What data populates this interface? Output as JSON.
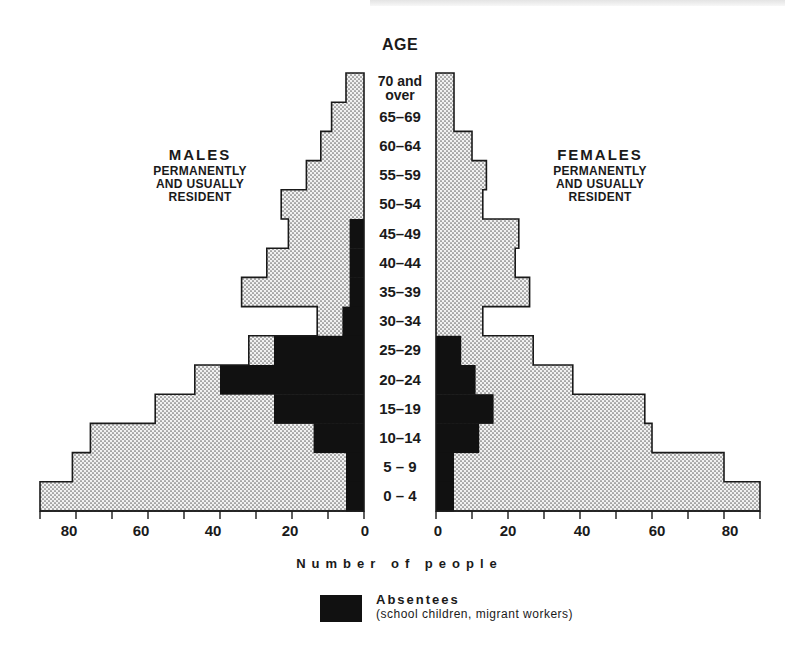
{
  "chart_data": {
    "type": "bar",
    "subtype": "population-pyramid",
    "title": "",
    "center_label": "AGE",
    "xlabel": "Number of people",
    "ylabel": "AGE",
    "xlim": [
      0,
      90
    ],
    "x_ticks": [
      0,
      20,
      40,
      60,
      80
    ],
    "x_minor_ticks_every": 10,
    "grid": false,
    "categories": [
      "70 and over",
      "65-69",
      "60-64",
      "55-59",
      "50-54",
      "45-49",
      "40-44",
      "35-39",
      "30-34",
      "25-29",
      "20-24",
      "15-19",
      "10-14",
      "5-9",
      "0-4"
    ],
    "series": [
      {
        "name": "Males permanently and usually resident (total)",
        "side": "left",
        "fill": "dotted",
        "values": [
          5,
          9,
          12,
          16,
          23,
          21,
          27,
          34,
          13,
          32,
          47,
          58,
          76,
          81,
          90
        ]
      },
      {
        "name": "Males absentees",
        "side": "left",
        "fill": "solid",
        "values": [
          0,
          0,
          0,
          0,
          0,
          4,
          4,
          4,
          6,
          25,
          40,
          25,
          14,
          5,
          5
        ]
      },
      {
        "name": "Females permanently and usually resident (total)",
        "side": "right",
        "fill": "dotted",
        "values": [
          5,
          5,
          10,
          14,
          13,
          23,
          22,
          26,
          13,
          27,
          38,
          58,
          60,
          80,
          90
        ]
      },
      {
        "name": "Females absentees",
        "side": "right",
        "fill": "solid",
        "values": [
          0,
          0,
          0,
          0,
          0,
          0,
          0,
          0,
          0,
          7,
          11,
          16,
          12,
          5,
          5
        ]
      }
    ],
    "legend": [
      {
        "label": "Absentees",
        "sublabel": "(school children, migrant workers)",
        "color": "#111111"
      }
    ],
    "annotations": [
      "MALES PERMANENTLY AND USUALLY RESIDENT",
      "FEMALES PERMANENTLY AND USUALLY RESIDENT"
    ]
  },
  "labels": {
    "age": "AGE",
    "ages": [
      {
        "line1": "70 and",
        "line2": "over"
      },
      {
        "line1": "65–69"
      },
      {
        "line1": "60–64"
      },
      {
        "line1": "55–59"
      },
      {
        "line1": "50–54"
      },
      {
        "line1": "45–49"
      },
      {
        "line1": "40–44"
      },
      {
        "line1": "35–39"
      },
      {
        "line1": "30–34"
      },
      {
        "line1": "25–29"
      },
      {
        "line1": "20–24"
      },
      {
        "line1": "15–19"
      },
      {
        "line1": "10–14"
      },
      {
        "line1": "5 – 9"
      },
      {
        "line1": "0 – 4"
      }
    ],
    "males": {
      "title": "MALES",
      "l1": "PERMANENTLY",
      "l2": "AND USUALLY",
      "l3": "RESIDENT"
    },
    "females": {
      "title": "FEMALES",
      "l1": "PERMANENTLY",
      "l2": "AND USUALLY",
      "l3": "RESIDENT"
    },
    "ticks_left": [
      "80",
      "60",
      "40",
      "20",
      "0"
    ],
    "ticks_right": [
      "0",
      "20",
      "40",
      "60",
      "80"
    ],
    "axis_title": "Number of people",
    "legend_title": "Absentees",
    "legend_sub": "(school children, migrant workers)"
  },
  "colors": {
    "ink": "#1a1a1a",
    "absentee": "#111111",
    "dot_bg": "#f2f2f2",
    "dot": "#6a6a6a"
  }
}
